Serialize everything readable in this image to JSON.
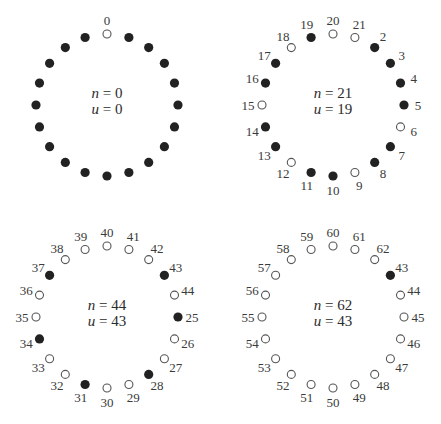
{
  "diagram": {
    "radius": 71,
    "label_radius": 85,
    "colors": {
      "filled": "#222222",
      "open_stroke": "#555555",
      "text": "#3a3a3a"
    },
    "panels": [
      {
        "id": "top-left",
        "center": [
          107,
          105
        ],
        "n_label": "n = 0",
        "u_label": "u = 0",
        "n_value": "0",
        "u_value": "0",
        "show_labels": "only-top",
        "nodes": [
          {
            "label": "0",
            "filled": false
          },
          {
            "label": "",
            "filled": true
          },
          {
            "label": "",
            "filled": true
          },
          {
            "label": "",
            "filled": true
          },
          {
            "label": "",
            "filled": true
          },
          {
            "label": "",
            "filled": true
          },
          {
            "label": "",
            "filled": true
          },
          {
            "label": "",
            "filled": true
          },
          {
            "label": "",
            "filled": true
          },
          {
            "label": "",
            "filled": true
          },
          {
            "label": "",
            "filled": true
          },
          {
            "label": "",
            "filled": true
          },
          {
            "label": "",
            "filled": true
          },
          {
            "label": "",
            "filled": true
          },
          {
            "label": "",
            "filled": true
          },
          {
            "label": "",
            "filled": true
          },
          {
            "label": "",
            "filled": true
          },
          {
            "label": "",
            "filled": true
          },
          {
            "label": "",
            "filled": true
          },
          {
            "label": "",
            "filled": true
          }
        ]
      },
      {
        "id": "top-right",
        "center": [
          333,
          105
        ],
        "n_value": "21",
        "u_value": "19",
        "nodes": [
          {
            "label": "20",
            "filled": false
          },
          {
            "label": "21",
            "filled": false
          },
          {
            "label": "2",
            "filled": true
          },
          {
            "label": "3",
            "filled": true
          },
          {
            "label": "4",
            "filled": true
          },
          {
            "label": "5",
            "filled": true
          },
          {
            "label": "6",
            "filled": false
          },
          {
            "label": "7",
            "filled": true
          },
          {
            "label": "8",
            "filled": true
          },
          {
            "label": "9",
            "filled": false
          },
          {
            "label": "10",
            "filled": true
          },
          {
            "label": "11",
            "filled": true
          },
          {
            "label": "12",
            "filled": false
          },
          {
            "label": "13",
            "filled": true
          },
          {
            "label": "14",
            "filled": true
          },
          {
            "label": "15",
            "filled": false
          },
          {
            "label": "16",
            "filled": true
          },
          {
            "label": "17",
            "filled": true
          },
          {
            "label": "18",
            "filled": false
          },
          {
            "label": "19",
            "filled": true
          }
        ]
      },
      {
        "id": "bottom-left",
        "center": [
          107,
          317
        ],
        "n_value": "44",
        "u_value": "43",
        "nodes": [
          {
            "label": "40",
            "filled": false
          },
          {
            "label": "41",
            "filled": false
          },
          {
            "label": "42",
            "filled": false
          },
          {
            "label": "43",
            "filled": true
          },
          {
            "label": "44",
            "filled": false
          },
          {
            "label": "25",
            "filled": true
          },
          {
            "label": "26",
            "filled": false
          },
          {
            "label": "27",
            "filled": false
          },
          {
            "label": "28",
            "filled": true
          },
          {
            "label": "29",
            "filled": false
          },
          {
            "label": "30",
            "filled": false
          },
          {
            "label": "31",
            "filled": true
          },
          {
            "label": "32",
            "filled": false
          },
          {
            "label": "33",
            "filled": false
          },
          {
            "label": "34",
            "filled": true
          },
          {
            "label": "35",
            "filled": false
          },
          {
            "label": "36",
            "filled": false
          },
          {
            "label": "37",
            "filled": true
          },
          {
            "label": "38",
            "filled": false
          },
          {
            "label": "39",
            "filled": false
          }
        ]
      },
      {
        "id": "bottom-right",
        "center": [
          333,
          317
        ],
        "n_value": "62",
        "u_value": "43",
        "nodes": [
          {
            "label": "60",
            "filled": false
          },
          {
            "label": "61",
            "filled": false
          },
          {
            "label": "62",
            "filled": false
          },
          {
            "label": "43",
            "filled": true
          },
          {
            "label": "44",
            "filled": false
          },
          {
            "label": "45",
            "filled": false
          },
          {
            "label": "46",
            "filled": false
          },
          {
            "label": "47",
            "filled": false
          },
          {
            "label": "48",
            "filled": false
          },
          {
            "label": "49",
            "filled": false
          },
          {
            "label": "50",
            "filled": false
          },
          {
            "label": "51",
            "filled": false
          },
          {
            "label": "52",
            "filled": false
          },
          {
            "label": "53",
            "filled": false
          },
          {
            "label": "54",
            "filled": false
          },
          {
            "label": "55",
            "filled": false
          },
          {
            "label": "56",
            "filled": false
          },
          {
            "label": "57",
            "filled": false
          },
          {
            "label": "58",
            "filled": false
          },
          {
            "label": "59",
            "filled": false
          }
        ]
      }
    ]
  }
}
